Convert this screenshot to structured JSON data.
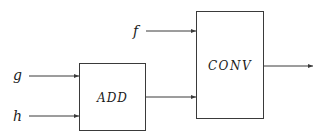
{
  "diagram": {
    "type": "block-diagram",
    "inputs": [
      {
        "id": "g",
        "label": "g",
        "target": "ADD"
      },
      {
        "id": "h",
        "label": "h",
        "target": "ADD"
      },
      {
        "id": "f",
        "label": "f",
        "target": "CONV"
      }
    ],
    "blocks": [
      {
        "id": "ADD",
        "label": "ADD"
      },
      {
        "id": "CONV",
        "label": "CONV"
      }
    ],
    "connections": [
      {
        "from": "g",
        "to": "ADD"
      },
      {
        "from": "h",
        "to": "ADD"
      },
      {
        "from": "f",
        "to": "CONV"
      },
      {
        "from": "ADD",
        "to": "CONV"
      },
      {
        "from": "CONV",
        "to": "output"
      }
    ],
    "colors": {
      "stroke": "#3a3a3a",
      "text": "#1a1a1a",
      "background": "#ffffff"
    }
  }
}
